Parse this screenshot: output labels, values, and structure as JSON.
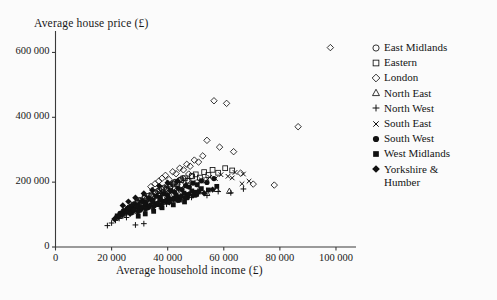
{
  "chart_data": {
    "type": "scatter",
    "title": "",
    "xlabel": "Average household income (£)",
    "ylabel": "Average house price (£)",
    "xlim": [
      0,
      105000
    ],
    "ylim": [
      0,
      660000
    ],
    "xticks": [
      0,
      20000,
      40000,
      60000,
      80000,
      100000
    ],
    "xticklabels": [
      "0",
      "20 000",
      "40 000",
      "60 000",
      "80 000",
      "100 000"
    ],
    "yticks": [
      0,
      200000,
      400000,
      600000
    ],
    "yticklabels": [
      "0",
      "200 000",
      "400 000",
      "600 000"
    ],
    "grid": false,
    "legend_position": "right",
    "series": [
      {
        "name": "East Midlands",
        "marker": "open-circle",
        "color": "#111111",
        "points": [
          [
            24100,
            108000
          ],
          [
            25400,
            112000
          ],
          [
            26200,
            118000
          ],
          [
            27000,
            124000
          ],
          [
            27800,
            131000
          ],
          [
            28600,
            127000
          ],
          [
            29400,
            139000
          ],
          [
            30100,
            145000
          ],
          [
            30900,
            136000
          ],
          [
            31700,
            152000
          ],
          [
            32500,
            149000
          ],
          [
            33200,
            158000
          ],
          [
            34000,
            161000
          ],
          [
            34800,
            155000
          ],
          [
            35600,
            168000
          ],
          [
            36400,
            172000
          ],
          [
            37100,
            164000
          ],
          [
            37900,
            179000
          ],
          [
            38700,
            183000
          ],
          [
            39500,
            176000
          ],
          [
            40300,
            190000
          ],
          [
            41000,
            186000
          ],
          [
            41800,
            196000
          ],
          [
            42600,
            201000
          ],
          [
            43400,
            193000
          ],
          [
            44200,
            206000
          ],
          [
            45500,
            212000
          ],
          [
            47000,
            205000
          ],
          [
            48500,
            219000
          ]
        ]
      },
      {
        "name": "Eastern",
        "marker": "open-square",
        "color": "#111111",
        "points": [
          [
            26500,
            121000
          ],
          [
            27900,
            129000
          ],
          [
            29200,
            136000
          ],
          [
            30500,
            143000
          ],
          [
            31800,
            151000
          ],
          [
            33100,
            147000
          ],
          [
            34400,
            158000
          ],
          [
            35700,
            165000
          ],
          [
            37000,
            172000
          ],
          [
            38300,
            168000
          ],
          [
            39600,
            180000
          ],
          [
            40900,
            187000
          ],
          [
            42200,
            193000
          ],
          [
            43500,
            199000
          ],
          [
            44800,
            206000
          ],
          [
            46100,
            212000
          ],
          [
            47400,
            204000
          ],
          [
            48700,
            218000
          ],
          [
            50000,
            224000
          ],
          [
            51500,
            214000
          ],
          [
            53000,
            231000
          ],
          [
            54500,
            222000
          ],
          [
            56000,
            238000
          ],
          [
            58000,
            229000
          ],
          [
            60500,
            243000
          ],
          [
            63000,
            236000
          ]
        ]
      },
      {
        "name": "London",
        "marker": "open-diamond",
        "color": "#111111",
        "points": [
          [
            34000,
            186000
          ],
          [
            35500,
            195000
          ],
          [
            36800,
            203000
          ],
          [
            38000,
            212000
          ],
          [
            39200,
            221000
          ],
          [
            40500,
            208000
          ],
          [
            41800,
            232000
          ],
          [
            43000,
            226000
          ],
          [
            44300,
            243000
          ],
          [
            45600,
            238000
          ],
          [
            46800,
            255000
          ],
          [
            48000,
            249000
          ],
          [
            49500,
            268000
          ],
          [
            51000,
            262000
          ],
          [
            52500,
            281000
          ],
          [
            54000,
            329000
          ],
          [
            56500,
            451000
          ],
          [
            58500,
            308000
          ],
          [
            61000,
            443000
          ],
          [
            63500,
            294000
          ],
          [
            66000,
            228000
          ],
          [
            70500,
            194000
          ],
          [
            78000,
            191000
          ],
          [
            86500,
            371000
          ],
          [
            98000,
            615000
          ],
          [
            44800,
            210000
          ],
          [
            47500,
            225000
          ],
          [
            50500,
            199000
          ],
          [
            53500,
            206000
          ],
          [
            42500,
            198000
          ],
          [
            39800,
            190000
          ],
          [
            37500,
            181000
          ]
        ]
      },
      {
        "name": "North East",
        "marker": "open-triangle",
        "color": "#111111",
        "points": [
          [
            21500,
            92000
          ],
          [
            22800,
            98000
          ],
          [
            24000,
            104000
          ],
          [
            25200,
            110000
          ],
          [
            26400,
            106000
          ],
          [
            27600,
            117000
          ],
          [
            28800,
            123000
          ],
          [
            30000,
            119000
          ],
          [
            31200,
            130000
          ],
          [
            32400,
            126000
          ],
          [
            33600,
            137000
          ],
          [
            34800,
            133000
          ],
          [
            36000,
            144000
          ],
          [
            37200,
            140000
          ],
          [
            38400,
            151000
          ],
          [
            39600,
            147000
          ],
          [
            41000,
            157000
          ],
          [
            42500,
            152000
          ],
          [
            44000,
            163000
          ],
          [
            46000,
            158000
          ],
          [
            48500,
            169000
          ],
          [
            51000,
            174000
          ],
          [
            54000,
            166000
          ],
          [
            57500,
            178000
          ],
          [
            62000,
            172000
          ]
        ]
      },
      {
        "name": "North West",
        "marker": "plus",
        "color": "#111111",
        "points": [
          [
            18500,
            66000
          ],
          [
            20000,
            74000
          ],
          [
            21400,
            82000
          ],
          [
            22700,
            88000
          ],
          [
            24000,
            95000
          ],
          [
            25300,
            91000
          ],
          [
            26600,
            102000
          ],
          [
            27900,
            108000
          ],
          [
            29200,
            104000
          ],
          [
            30500,
            115000
          ],
          [
            31800,
            111000
          ],
          [
            33100,
            122000
          ],
          [
            34400,
            118000
          ],
          [
            35700,
            129000
          ],
          [
            37000,
            125000
          ],
          [
            38300,
            136000
          ],
          [
            39600,
            132000
          ],
          [
            40900,
            143000
          ],
          [
            42200,
            139000
          ],
          [
            43500,
            150000
          ],
          [
            45000,
            146000
          ],
          [
            46500,
            157000
          ],
          [
            48500,
            153000
          ],
          [
            51000,
            164000
          ],
          [
            54000,
            159000
          ],
          [
            58000,
            171000
          ],
          [
            62500,
            167000
          ],
          [
            67000,
            179000
          ],
          [
            31500,
            72000
          ],
          [
            28500,
            68000
          ]
        ]
      },
      {
        "name": "South East",
        "marker": "cross",
        "color": "#111111",
        "points": [
          [
            28000,
            128000
          ],
          [
            29500,
            136000
          ],
          [
            31000,
            144000
          ],
          [
            32500,
            152000
          ],
          [
            34000,
            148000
          ],
          [
            35500,
            160000
          ],
          [
            37000,
            167000
          ],
          [
            38500,
            163000
          ],
          [
            40000,
            175000
          ],
          [
            41500,
            171000
          ],
          [
            43000,
            183000
          ],
          [
            44500,
            179000
          ],
          [
            46000,
            191000
          ],
          [
            47500,
            187000
          ],
          [
            49000,
            199000
          ],
          [
            50500,
            195000
          ],
          [
            52000,
            207000
          ],
          [
            53500,
            203000
          ],
          [
            55000,
            215000
          ],
          [
            57000,
            211000
          ],
          [
            59000,
            223000
          ],
          [
            61500,
            218000
          ],
          [
            64000,
            230000
          ],
          [
            67000,
            225000
          ],
          [
            66500,
            195000
          ],
          [
            69000,
            203000
          ],
          [
            63000,
            213000
          ]
        ]
      },
      {
        "name": "South West",
        "marker": "filled-circle",
        "color": "#111111",
        "points": [
          [
            23000,
            104000
          ],
          [
            24300,
            112000
          ],
          [
            25600,
            119000
          ],
          [
            26900,
            126000
          ],
          [
            28200,
            133000
          ],
          [
            29500,
            129000
          ],
          [
            30800,
            141000
          ],
          [
            32100,
            137000
          ],
          [
            33400,
            149000
          ],
          [
            34700,
            145000
          ],
          [
            36000,
            157000
          ],
          [
            37300,
            153000
          ],
          [
            38600,
            165000
          ],
          [
            39900,
            161000
          ],
          [
            41200,
            173000
          ],
          [
            42500,
            169000
          ],
          [
            43800,
            181000
          ],
          [
            45100,
            177000
          ],
          [
            46400,
            189000
          ],
          [
            47700,
            185000
          ],
          [
            49000,
            197000
          ],
          [
            50500,
            192000
          ],
          [
            52000,
            204000
          ],
          [
            54000,
            199000
          ],
          [
            56500,
            211000
          ],
          [
            43000,
            149000
          ],
          [
            40000,
            140000
          ],
          [
            36500,
            131000
          ],
          [
            33000,
            122000
          ],
          [
            30000,
            113000
          ],
          [
            27000,
            106000
          ],
          [
            50000,
            160000
          ],
          [
            47000,
            152000
          ],
          [
            44000,
            144000
          ]
        ]
      },
      {
        "name": "West Midlands",
        "marker": "filled-square",
        "color": "#111111",
        "points": [
          [
            22000,
            96000
          ],
          [
            23400,
            103000
          ],
          [
            24800,
            110000
          ],
          [
            26200,
            117000
          ],
          [
            27600,
            113000
          ],
          [
            29000,
            124000
          ],
          [
            30400,
            120000
          ],
          [
            31800,
            131000
          ],
          [
            33200,
            127000
          ],
          [
            34600,
            138000
          ],
          [
            36000,
            134000
          ],
          [
            37400,
            145000
          ],
          [
            38800,
            141000
          ],
          [
            40200,
            152000
          ],
          [
            41600,
            148000
          ],
          [
            43000,
            159000
          ],
          [
            44400,
            155000
          ],
          [
            45800,
            166000
          ],
          [
            47200,
            162000
          ],
          [
            48600,
            173000
          ],
          [
            50000,
            169000
          ],
          [
            52000,
            180000
          ],
          [
            54500,
            176000
          ],
          [
            57500,
            187000
          ],
          [
            35000,
            110000
          ],
          [
            32000,
            102000
          ],
          [
            29500,
            95000
          ],
          [
            46000,
            139000
          ],
          [
            42000,
            130000
          ],
          [
            38000,
            121000
          ]
        ]
      },
      {
        "name": "Yorkshire & Humber",
        "marker": "filled-diamond",
        "color": "#111111",
        "points": [
          [
            21000,
            86000
          ],
          [
            22400,
            93000
          ],
          [
            23800,
            100000
          ],
          [
            25200,
            107000
          ],
          [
            26600,
            103000
          ],
          [
            28000,
            114000
          ],
          [
            29400,
            110000
          ],
          [
            30800,
            121000
          ],
          [
            32200,
            117000
          ],
          [
            33600,
            128000
          ],
          [
            35000,
            124000
          ],
          [
            36400,
            135000
          ],
          [
            37800,
            131000
          ],
          [
            39200,
            142000
          ],
          [
            40600,
            138000
          ],
          [
            42000,
            149000
          ],
          [
            43400,
            145000
          ],
          [
            44800,
            156000
          ],
          [
            46200,
            152000
          ],
          [
            47600,
            163000
          ],
          [
            49000,
            159000
          ],
          [
            51000,
            170000
          ],
          [
            40000,
            198000
          ],
          [
            43500,
            203000
          ],
          [
            37000,
            188000
          ],
          [
            34500,
            176000
          ],
          [
            31500,
            165000
          ],
          [
            28500,
            152000
          ],
          [
            26000,
            140000
          ],
          [
            24000,
            128000
          ],
          [
            53000,
            166000
          ],
          [
            56000,
            177000
          ]
        ]
      }
    ]
  },
  "legend": {
    "items": [
      {
        "label": "East Midlands",
        "marker": "open-circle"
      },
      {
        "label": "Eastern",
        "marker": "open-square"
      },
      {
        "label": "London",
        "marker": "open-diamond"
      },
      {
        "label": "North East",
        "marker": "open-triangle"
      },
      {
        "label": "North West",
        "marker": "plus"
      },
      {
        "label": "South East",
        "marker": "cross"
      },
      {
        "label": "South West",
        "marker": "filled-circle"
      },
      {
        "label": "West Midlands",
        "marker": "filled-square"
      },
      {
        "label": "Yorkshire &",
        "label_cont": "Humber",
        "marker": "filled-diamond"
      }
    ]
  },
  "style": {
    "background": "#fbfbfb",
    "axis_color": "#3a3a3a",
    "marker_color": "#111111"
  }
}
